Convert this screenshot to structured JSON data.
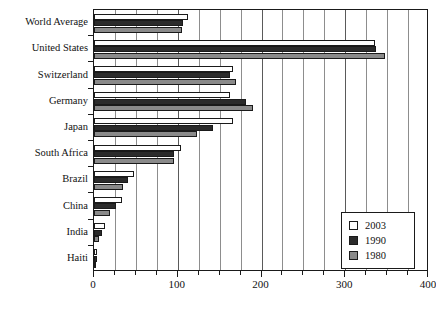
{
  "chart_data": {
    "type": "bar",
    "orientation": "horizontal",
    "title": "",
    "subtitle": "",
    "xlabel": "",
    "ylabel": "",
    "xlim": [
      0,
      400
    ],
    "xticks": [
      0,
      100,
      200,
      300,
      400
    ],
    "xtick_labels": [
      "0",
      "100",
      "200",
      "300",
      "400"
    ],
    "minor_tick_step": 25,
    "grid": "vertical",
    "legend_position": "lower-right",
    "categories": [
      "World Average",
      "United States",
      "Switzerland",
      "Germany",
      "Japan",
      "South Africa",
      "Brazil",
      "China",
      "India",
      "Haiti"
    ],
    "series": [
      {
        "name": "2003",
        "color": "#ffffff",
        "values": [
          112,
          336,
          166,
          162,
          166,
          104,
          48,
          34,
          13,
          3
        ]
      },
      {
        "name": "1990",
        "color": "#2b2b2b",
        "values": [
          106,
          337,
          162,
          182,
          142,
          95,
          41,
          26,
          9,
          3
        ]
      },
      {
        "name": "1980",
        "color": "#8a8a8a",
        "values": [
          105,
          347,
          169,
          190,
          123,
          95,
          35,
          19,
          6,
          2
        ]
      }
    ]
  },
  "legend": {
    "entries": [
      {
        "label": "2003",
        "swatch": "white-square-swatch"
      },
      {
        "label": "1990",
        "swatch": "black-square-swatch"
      },
      {
        "label": "1980",
        "swatch": "gray-square-swatch"
      }
    ]
  },
  "colors": {
    "axis": "#1a1a1a",
    "grid": "#8d8d8d",
    "background": "#ffffff",
    "series_2003": "#ffffff",
    "series_1990": "#2b2b2b",
    "series_1980": "#8a8a8a"
  }
}
